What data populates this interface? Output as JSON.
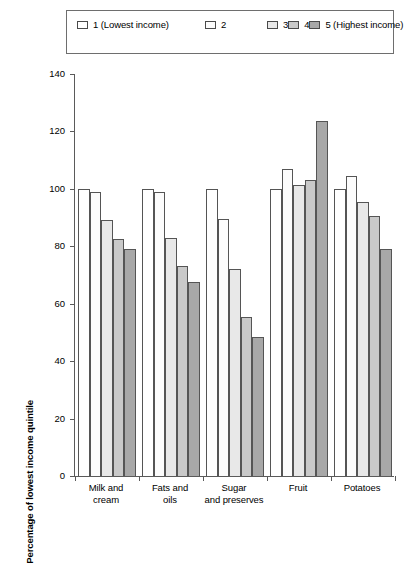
{
  "chart_data": {
    "type": "bar",
    "title": "",
    "xlabel": "",
    "ylabel": "Percentage of lowest income quintile",
    "ylim": [
      0,
      140
    ],
    "ytick_values": [
      0,
      20,
      40,
      60,
      80,
      100,
      120,
      140
    ],
    "ytick_labels": [
      "0",
      "20",
      "40",
      "60",
      "80",
      "100",
      "120",
      "140"
    ],
    "grid": false,
    "legend_position": "top",
    "categories": [
      "Milk and\ncream",
      "Fats and\noils",
      "Sugar\nand preserves",
      "Fruit",
      "Potatoes"
    ],
    "series": [
      {
        "name": "1 (Lowest income)",
        "color": "#ffffff",
        "values": [
          100,
          100,
          100,
          100,
          100
        ]
      },
      {
        "name": "2",
        "color": "#fcfcfc",
        "values": [
          99,
          99,
          89.5,
          107,
          104.5
        ]
      },
      {
        "name": "3",
        "color": "#e8e8e8",
        "values": [
          89,
          83,
          72,
          101.5,
          95.5
        ]
      },
      {
        "name": "4",
        "color": "#c9c9c9",
        "values": [
          82.5,
          73,
          55.5,
          103,
          90.5
        ]
      },
      {
        "name": "5 (Highest income)",
        "color": "#a8a8a8",
        "values": [
          79,
          67.5,
          48.5,
          123.5,
          79
        ]
      }
    ]
  },
  "legend": {
    "entries": [
      "1 (Lowest income)",
      "2",
      "3",
      "4",
      "5 (Highest income)"
    ]
  }
}
